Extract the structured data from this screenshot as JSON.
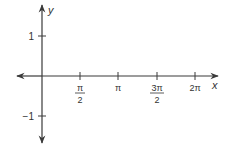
{
  "diagram": {
    "type": "coordinate-axes",
    "colors": {
      "axis": "#3a3a3a",
      "text": "#333333",
      "background": "#ffffff"
    },
    "axes": {
      "x_label": "x",
      "y_label": "y"
    },
    "y_ticks": [
      {
        "value": 1,
        "label": "1"
      },
      {
        "value": -1,
        "label": "−1"
      }
    ],
    "x_ticks": [
      {
        "value": "π/2",
        "numerator": "π",
        "denominator": "2"
      },
      {
        "value": "π",
        "label": "π"
      },
      {
        "value": "3π/2",
        "numerator": "3π",
        "denominator": "2"
      },
      {
        "value": "2π",
        "label": "2π"
      }
    ]
  }
}
